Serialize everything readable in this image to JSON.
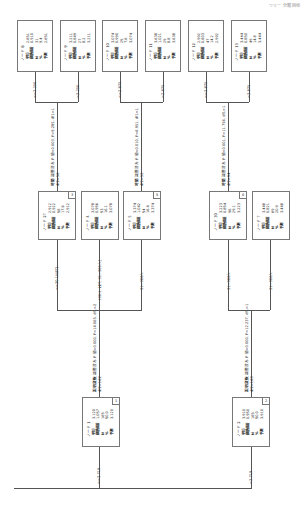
{
  "header": {
    "text": "ツリー 分類 回帰"
  },
  "colors": {
    "line": "#555555",
    "box_border": "#777777"
  },
  "root_edges": [
    {
      "label": "<=3.719"
    },
    {
      "label": ">3.719"
    }
  ],
  "level1": [
    {
      "id": "n1",
      "title": "ノード 1",
      "tag": "1",
      "rows": [
        {
          "k": "平均",
          "v": "3.120"
        },
        {
          "k": "標準偏差",
          "v": "1.057"
        },
        {
          "k": "N",
          "v": "165"
        },
        {
          "k": "%",
          "v": "50.0"
        },
        {
          "k": "予測",
          "v": "3.120"
        }
      ],
      "split": {
        "var": "説明変数",
        "stat": "調整済み P 値=0.000, F=14.065, df1=2",
        "df2": "df2=162"
      }
    },
    {
      "id": "n2",
      "title": "ノード 2",
      "tag": "2",
      "rows": [
        {
          "k": "平均",
          "v": "3.910"
        },
        {
          "k": "標準偏差",
          "v": "0.950"
        },
        {
          "k": "N",
          "v": "165"
        },
        {
          "k": "%",
          "v": "50.0"
        },
        {
          "k": "予測",
          "v": "3.910"
        }
      ],
      "split": {
        "var": "説明変数",
        "stat": "調整済み P 値=0.000, F=12.237, df1=1",
        "df2": "df2=163"
      }
    }
  ],
  "level2": [
    {
      "id": "n3",
      "title": "ノード 27",
      "tag": "3",
      "edge": "<=30.1(LET)",
      "rows": [
        {
          "k": "平均",
          "v": "2.912"
        },
        {
          "k": "標準偏差",
          "v": "0.922"
        },
        {
          "k": "N",
          "v": "58"
        },
        {
          "k": "%",
          "v": "17.6"
        },
        {
          "k": "予測",
          "v": "2.912"
        }
      ],
      "split": {
        "var": "時間",
        "stat": "調整済み P 値=0.003, F=9.285, df1=1",
        "df2": "df2=56"
      }
    },
    {
      "id": "n4",
      "title": "ノード 4",
      "tag": "4",
      "edge": "(30.1, LET, 31~300人]",
      "rows": [
        {
          "k": "平均",
          "v": "3.078"
        },
        {
          "k": "標準偏差",
          "v": "0.956"
        },
        {
          "k": "N",
          "v": "53"
        },
        {
          "k": "%",
          "v": "16.1"
        },
        {
          "k": "予測",
          "v": "3.078"
        }
      ]
    },
    {
      "id": "n5",
      "title": "ノード 5",
      "tag": "5",
      "edge": "31~300人",
      "rows": [
        {
          "k": "平均",
          "v": "3.374"
        },
        {
          "k": "標準偏差",
          "v": "1.042"
        },
        {
          "k": "N",
          "v": "54"
        },
        {
          "k": "%",
          "v": "16.4"
        },
        {
          "k": "予測",
          "v": "3.374"
        }
      ],
      "split": {
        "var": "時間",
        "stat": "調整済み P 値=0.010, F=6.951, df1=1",
        "df2": "df2=52"
      }
    },
    {
      "id": "n6",
      "title": "ノード 30",
      "tag": "6",
      "edge": "31~300人",
      "rows": [
        {
          "k": "平均",
          "v": "3.223"
        },
        {
          "k": "標準偏差",
          "v": "0.854"
        },
        {
          "k": "N",
          "v": "96"
        },
        {
          "k": "%",
          "v": "29.1"
        },
        {
          "k": "予測",
          "v": "3.223"
        }
      ],
      "split": {
        "var": "時間",
        "stat": "調整済み P 値=0.001, F=11.756, df1=1",
        "df2": "df2=94"
      }
    },
    {
      "id": "n7",
      "title": "ノード 7",
      "tag": "7",
      "edge": "31~300人",
      "rows": [
        {
          "k": "平均",
          "v": "3.448"
        },
        {
          "k": "標準偏差",
          "v": "0.821"
        },
        {
          "k": "N",
          "v": "69"
        },
        {
          "k": "%",
          "v": "20.9"
        },
        {
          "k": "予測",
          "v": "3.448"
        }
      ]
    }
  ],
  "level3": [
    {
      "id": "n8",
      "title": "ノード 8",
      "edge": "<=3.250",
      "rows": [
        {
          "k": "平均",
          "v": "2.651"
        },
        {
          "k": "標準偏差",
          "v": "0.910"
        },
        {
          "k": "N",
          "v": "31"
        },
        {
          "k": "%",
          "v": "9.4"
        },
        {
          "k": "予測",
          "v": "2.651"
        }
      ]
    },
    {
      "id": "n9",
      "title": "ノード 9",
      "edge": ">3.250",
      "rows": [
        {
          "k": "平均",
          "v": "3.211"
        },
        {
          "k": "標準偏差",
          "v": "0.849"
        },
        {
          "k": "N",
          "v": "27"
        },
        {
          "k": "%",
          "v": "8.2"
        },
        {
          "k": "予測",
          "v": "3.211"
        }
      ]
    },
    {
      "id": "n10",
      "title": "ノード 10",
      "edge": "<=2.875",
      "rows": [
        {
          "k": "平均",
          "v": "3.074"
        },
        {
          "k": "標準偏差",
          "v": "0.990"
        },
        {
          "k": "N",
          "v": "25"
        },
        {
          "k": "%",
          "v": "7.6"
        },
        {
          "k": "予測",
          "v": "3.074"
        }
      ]
    },
    {
      "id": "n11",
      "title": "ノード 11",
      "edge": ">2.875",
      "rows": [
        {
          "k": "平均",
          "v": "3.638"
        },
        {
          "k": "標準偏差",
          "v": "1.021"
        },
        {
          "k": "N",
          "v": "29"
        },
        {
          "k": "%",
          "v": "8.8"
        },
        {
          "k": "予測",
          "v": "3.638"
        }
      ]
    },
    {
      "id": "n12",
      "title": "ノード 12",
      "edge": "<=3.875",
      "rows": [
        {
          "k": "平均",
          "v": "2.992"
        },
        {
          "k": "標準偏差",
          "v": "0.803"
        },
        {
          "k": "N",
          "v": "47"
        },
        {
          "k": "%",
          "v": "14.2"
        },
        {
          "k": "予測",
          "v": "2.992"
        }
      ]
    },
    {
      "id": "n13",
      "title": "ノード 13",
      "edge": ">3.875",
      "rows": [
        {
          "k": "平均",
          "v": "3.444"
        },
        {
          "k": "標準偏差",
          "v": "0.850"
        },
        {
          "k": "N",
          "v": "49"
        },
        {
          "k": "%",
          "v": "14.8"
        },
        {
          "k": "予測",
          "v": "3.444"
        }
      ]
    }
  ]
}
